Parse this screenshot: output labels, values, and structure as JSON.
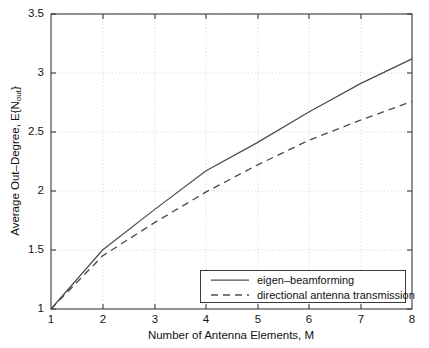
{
  "chart_data": {
    "type": "line",
    "title": "",
    "xlabel": "Number of Antenna Elements, M",
    "ylabel": "Average Out-Degree, E{N_out}",
    "ylabel_main": "Average Out–Degree, E{N",
    "ylabel_sub": "out",
    "ylabel_tail": "}",
    "x": [
      1,
      2,
      3,
      4,
      5,
      6,
      7,
      8
    ],
    "xlim": [
      1,
      8
    ],
    "ylim": [
      1,
      3.5
    ],
    "xticks": [
      "1",
      "2",
      "3",
      "4",
      "5",
      "6",
      "7",
      "8"
    ],
    "yticks": [
      "1",
      "1.5",
      "2",
      "2.5",
      "3",
      "3.5"
    ],
    "ytick_values": [
      1,
      1.5,
      2,
      2.5,
      3,
      3.5
    ],
    "xtick_values": [
      1,
      2,
      3,
      4,
      5,
      6,
      7,
      8
    ],
    "grid": true,
    "grid_style": "dotted",
    "legend_position": "lower right",
    "series": [
      {
        "name": "eigen–beamforming",
        "style": "solid",
        "color": "#4d4d4d",
        "values": [
          1.0,
          1.5,
          1.84,
          2.17,
          2.41,
          2.67,
          2.91,
          3.12
        ]
      },
      {
        "name": "directional antenna transmission",
        "style": "dashed",
        "color": "#4d4d4d",
        "values": [
          1.0,
          1.45,
          1.73,
          1.99,
          2.22,
          2.43,
          2.6,
          2.76
        ]
      }
    ]
  },
  "legend": {
    "items": [
      {
        "label": "eigen–beamforming",
        "style": "solid"
      },
      {
        "label": "directional antenna transmission",
        "style": "dashed"
      }
    ]
  },
  "colors": {
    "axis": "#3a3a3a",
    "grid": "#c9c9c9",
    "line": "#4d4d4d",
    "background": "#ffffff"
  }
}
